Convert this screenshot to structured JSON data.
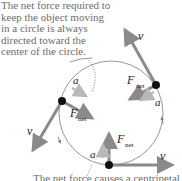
{
  "diagram": {
    "caption_top_lines": [
      "The net force required to",
      "keep the object moving",
      "in a circle is always",
      "directed toward the",
      "center of the circle."
    ],
    "caption_bottom": "The net force causes a centripetal",
    "labels": {
      "velocity": "v",
      "acceleration": "a",
      "force": "F",
      "force_subscript": "net"
    },
    "colors": {
      "velocity_arrow": "#8a8a8a",
      "force_arrow": "#8a8a8a",
      "acceleration_arrow": "#b8b8b8",
      "circle": "#7a7a7a",
      "object": "#111111",
      "caption_text": "#6d6d6d"
    },
    "positions": [
      {
        "name": "top-right",
        "velocity_dir": "up-left",
        "force_dir": "toward-center"
      },
      {
        "name": "left",
        "velocity_dir": "down-left",
        "force_dir": "toward-center"
      },
      {
        "name": "bottom",
        "velocity_dir": "right",
        "force_dir": "up"
      }
    ]
  }
}
